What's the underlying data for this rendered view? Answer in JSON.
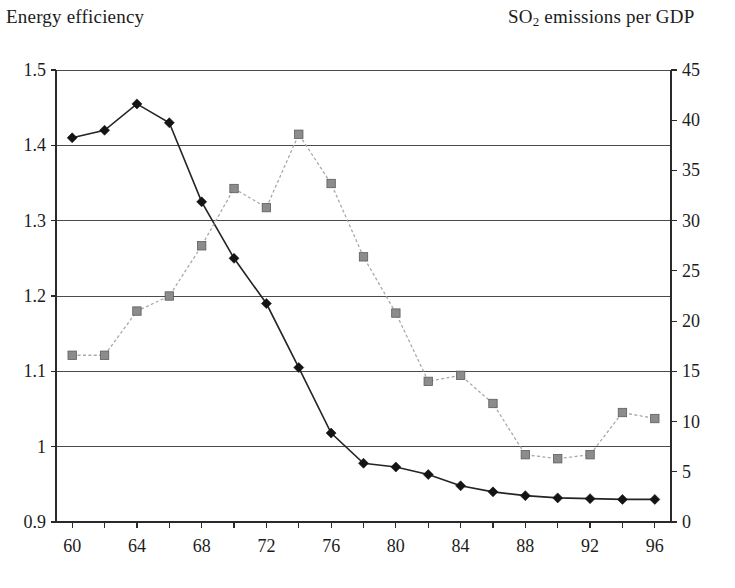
{
  "titles": {
    "left_axis_title": "Energy efficiency",
    "right_axis_title_pre": "SO",
    "right_axis_title_sub": "2",
    "right_axis_title_post": " emissions per GDP"
  },
  "chart_data": {
    "type": "line",
    "title": "",
    "subtitle": "",
    "xlabel": "",
    "ylabel": "Energy efficiency",
    "y2label": "SO2 emissions per GDP",
    "grid": true,
    "legend_position": "none",
    "x": [
      1960,
      1962,
      1964,
      1966,
      1968,
      1970,
      1972,
      1974,
      1976,
      1978,
      1980,
      1982,
      1984,
      1986,
      1988,
      1990,
      1992,
      1994,
      1996
    ],
    "x_tick_labels": [
      "60",
      "64",
      "68",
      "72",
      "76",
      "80",
      "84",
      "88",
      "92",
      "96"
    ],
    "x_tick_values": [
      1960,
      1964,
      1968,
      1972,
      1976,
      1980,
      1984,
      1988,
      1992,
      1996
    ],
    "xlim": [
      1959,
      1997
    ],
    "ylim": [
      0.9,
      1.5
    ],
    "y_ticks": [
      0.9,
      1.0,
      1.1,
      1.2,
      1.3,
      1.4,
      1.5
    ],
    "y_tick_labels": [
      "0.9",
      "1",
      "1.1",
      "1.2",
      "1.3",
      "1.4",
      "1.5"
    ],
    "y2lim": [
      0,
      45
    ],
    "y2_ticks": [
      0,
      5,
      10,
      15,
      20,
      25,
      30,
      35,
      40,
      45
    ],
    "y2_tick_labels": [
      "0",
      "5",
      "10",
      "15",
      "20",
      "25",
      "30",
      "35",
      "40",
      "45"
    ],
    "series": [
      {
        "name": "Energy efficiency",
        "axis": "left",
        "marker": "diamond",
        "color": "#141414",
        "linestyle": "solid",
        "values": [
          1.41,
          1.42,
          1.455,
          1.43,
          1.325,
          1.25,
          1.19,
          1.105,
          1.018,
          0.978,
          0.973,
          0.963,
          0.948,
          0.94,
          0.935,
          0.932,
          0.931,
          0.93,
          0.93
        ]
      },
      {
        "name": "SO2 emissions per GDP",
        "axis": "right",
        "marker": "square",
        "color": "#8c8c8c",
        "linestyle": "dotted",
        "values": [
          16.6,
          16.6,
          21.0,
          22.5,
          27.5,
          33.2,
          31.3,
          38.6,
          33.7,
          26.4,
          20.8,
          14.0,
          14.6,
          11.8,
          6.7,
          6.3,
          6.7,
          10.9,
          10.3
        ]
      }
    ]
  }
}
